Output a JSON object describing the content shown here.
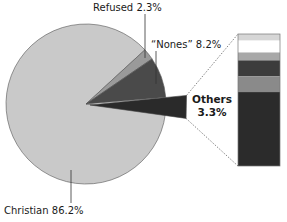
{
  "chart_data": {
    "type": "pie",
    "title": "",
    "slices": [
      {
        "name": "Christian",
        "label": "Christian 86.2%",
        "value": 86.2,
        "color": "#c9c9c9"
      },
      {
        "name": "Refused",
        "label": "Refused 2.3%",
        "value": 2.3,
        "color": "#9a9a9a"
      },
      {
        "name": "Nones",
        "label": "“Nones” 8.2%",
        "value": 8.2,
        "color": "#4a4a4a"
      },
      {
        "name": "Others",
        "label_line1": "Others",
        "label_line2": "3.3%",
        "value": 3.3,
        "color": "#2a2a2a",
        "exploded": true
      }
    ],
    "others_breakdown": {
      "type": "stacked-bar",
      "segments": [
        {
          "share": 0.05,
          "color": "#d6d6d6"
        },
        {
          "share": 0.09,
          "color": "#ffffff"
        },
        {
          "share": 0.06,
          "color": "#a8a8a8"
        },
        {
          "share": 0.12,
          "color": "#3c3c3c"
        },
        {
          "share": 0.12,
          "color": "#8a8a8a"
        },
        {
          "share": 0.56,
          "color": "#2b2b2b"
        }
      ]
    }
  }
}
